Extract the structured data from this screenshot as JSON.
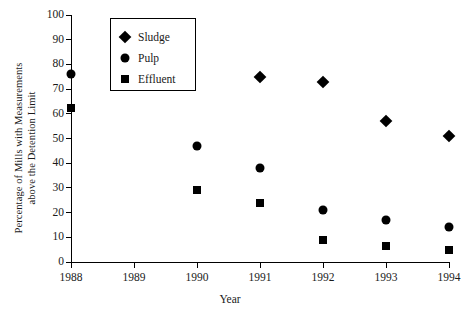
{
  "chart_data": {
    "type": "scatter",
    "title": "",
    "xlabel": "Year",
    "ylabel": "Percentage of Mills with Measurements above the Detention Limit",
    "ylabel_lines": [
      "Percentage of Mills with Measurements",
      "above the Detention Limit"
    ],
    "categories": [
      "1988",
      "1989",
      "1990",
      "1991",
      "1992",
      "1993",
      "1994"
    ],
    "x": [
      1988,
      1989,
      1990,
      1991,
      1992,
      1993,
      1994
    ],
    "xlim": [
      1988,
      1994
    ],
    "ylim": [
      0,
      100
    ],
    "ytick_labels": [
      "0",
      "10",
      "20",
      "30",
      "40",
      "50",
      "60",
      "70",
      "80",
      "90",
      "100"
    ],
    "yticks": [
      0,
      10,
      20,
      30,
      40,
      50,
      60,
      70,
      80,
      90,
      100
    ],
    "xtick_labels": [
      "1988",
      "1989",
      "1990",
      "1991",
      "1992",
      "1993",
      "1994"
    ],
    "grid": false,
    "legend_position": "upper-left-inside",
    "series": [
      {
        "name": "Sludge",
        "marker": "diamond",
        "color": "#000000",
        "points": [
          {
            "x": 1991,
            "y": 75
          },
          {
            "x": 1992,
            "y": 73
          },
          {
            "x": 1993,
            "y": 57
          },
          {
            "x": 1994,
            "y": 51
          }
        ]
      },
      {
        "name": "Pulp",
        "marker": "circle",
        "color": "#000000",
        "points": [
          {
            "x": 1988,
            "y": 76
          },
          {
            "x": 1990,
            "y": 47
          },
          {
            "x": 1991,
            "y": 38
          },
          {
            "x": 1992,
            "y": 21
          },
          {
            "x": 1993,
            "y": 17
          },
          {
            "x": 1994,
            "y": 14
          }
        ]
      },
      {
        "name": "Effluent",
        "marker": "square",
        "color": "#000000",
        "points": [
          {
            "x": 1988,
            "y": 62.5
          },
          {
            "x": 1990,
            "y": 29
          },
          {
            "x": 1991,
            "y": 24
          },
          {
            "x": 1992,
            "y": 9
          },
          {
            "x": 1993,
            "y": 6.5
          },
          {
            "x": 1994,
            "y": 5
          }
        ]
      }
    ]
  },
  "legend": {
    "items": [
      {
        "label": "Sludge",
        "marker": "diamond"
      },
      {
        "label": "Pulp",
        "marker": "circle"
      },
      {
        "label": "Effluent",
        "marker": "square"
      }
    ]
  }
}
